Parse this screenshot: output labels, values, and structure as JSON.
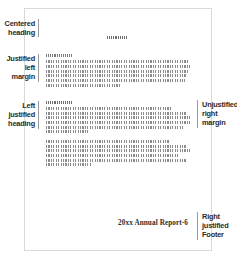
{
  "diagram": {
    "page": {
      "sheet_color": "#ffffff",
      "border_color": "#d9d9d9"
    },
    "annotations": {
      "centered_heading": {
        "lines": [
          "Centered",
          "heading"
        ]
      },
      "justified_left_margin": {
        "lines": [
          "Justified",
          "left",
          "margin"
        ]
      },
      "left_justified_heading": {
        "lines": [
          "Left",
          "justified",
          "heading"
        ]
      },
      "unjustified_right_margin": {
        "lines": [
          "Unjustified",
          "right",
          "margin"
        ]
      },
      "right_justified_footer": {
        "lines": [
          "Right",
          "justified",
          "Footer"
        ]
      }
    },
    "footer": {
      "text": "20xx Annual Report-6"
    },
    "greeked_text": {
      "note": "Body copy is rendered as simulated greeked rules, not readable words.",
      "centered_heading_widths": [
        21
      ],
      "paragraph_1_widths": [
        26,
        142,
        146,
        143,
        141,
        139,
        74
      ],
      "left_justified_heading_widths": [
        26
      ],
      "paragraph_2_widths": [
        126,
        140,
        146,
        144,
        138,
        42
      ],
      "paragraph_3_widths": [
        124,
        140,
        146,
        134,
        141,
        46
      ]
    },
    "colors": {
      "label_text": "#2b2b2b",
      "rule": "#9a9a9a",
      "greek_ink": "#8c8c8c",
      "footer_text": "#2e2e2e"
    }
  }
}
